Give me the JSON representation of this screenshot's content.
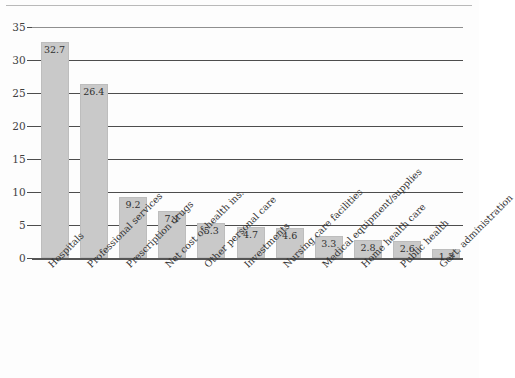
{
  "chart_data": {
    "type": "bar",
    "title": "",
    "xlabel": "",
    "ylabel": "",
    "ylim": [
      0,
      35
    ],
    "yticks": [
      0,
      5,
      10,
      15,
      20,
      25,
      30,
      35
    ],
    "grid": true,
    "legend": null,
    "orientation": "vertical",
    "bar_color": "#c9c9c9",
    "categories": [
      "Hospitals",
      "Professional services",
      "Prescription drugs",
      "Net cost of health ins.",
      "Other personal care",
      "Investments",
      "Nursing care facilities",
      "Medical equipment/supplies",
      "Home health care",
      "Public health",
      "Govt. administration"
    ],
    "values": [
      32.7,
      26.4,
      9.2,
      7.1,
      5.3,
      4.7,
      4.6,
      3.3,
      2.8,
      2.6,
      1.3
    ],
    "data_labels": [
      "32.7",
      "26.4",
      "9.2",
      "7.1",
      "5.3",
      "4.7",
      "4.6",
      "3.3",
      "2.8",
      "2.6",
      "1.3"
    ],
    "ytick_labels": [
      "0",
      "5",
      "10",
      "15",
      "20",
      "25",
      "30",
      "35"
    ]
  }
}
